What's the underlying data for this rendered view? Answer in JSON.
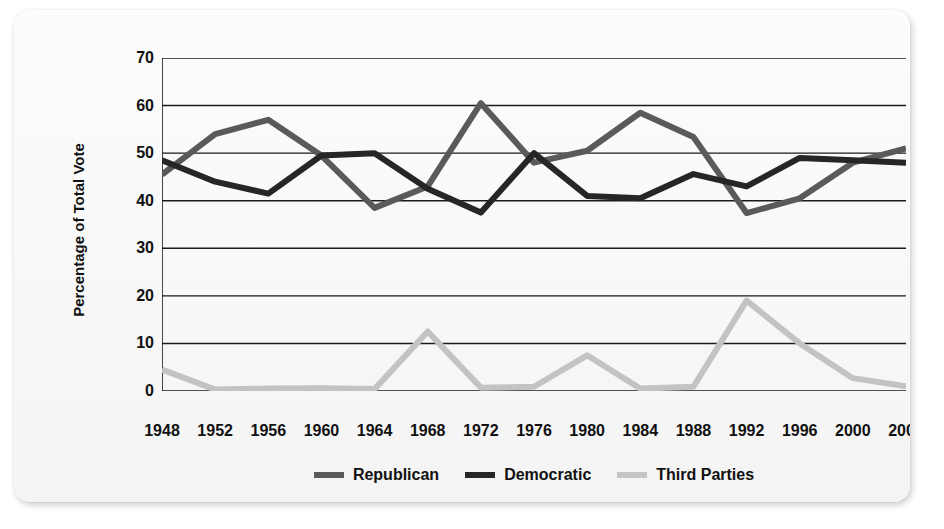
{
  "chart_data": {
    "type": "line",
    "title": "",
    "xlabel": "",
    "ylabel": "Percentage of Total Vote",
    "ylim": [
      0,
      70
    ],
    "yticks": [
      0,
      10,
      20,
      30,
      40,
      50,
      60,
      70
    ],
    "grid": true,
    "legend_position": "bottom",
    "categories": [
      "1948",
      "1952",
      "1956",
      "1960",
      "1964",
      "1968",
      "1972",
      "1976",
      "1980",
      "1984",
      "1988",
      "1992",
      "1996",
      "2000",
      "2004"
    ],
    "series": [
      {
        "name": "Republican",
        "color": "#5a5a5a",
        "values": [
          45.5,
          54.0,
          57.0,
          49.5,
          38.5,
          43.0,
          60.5,
          48.0,
          50.5,
          58.5,
          53.4,
          37.4,
          40.5,
          48.0,
          51.0
        ]
      },
      {
        "name": "Democratic",
        "color": "#262626",
        "values": [
          48.5,
          44.0,
          41.5,
          49.5,
          50.0,
          42.5,
          37.5,
          50.0,
          41.0,
          40.5,
          45.6,
          43.0,
          49.0,
          48.5,
          48.0
        ]
      },
      {
        "name": "Third Parties",
        "color": "#c3c3c3",
        "values": [
          4.5,
          0.3,
          0.5,
          0.6,
          0.4,
          12.5,
          0.7,
          0.9,
          7.5,
          0.5,
          0.9,
          19.0,
          10.0,
          2.7,
          1.0
        ]
      }
    ]
  },
  "axis": {
    "y_label": "Percentage of Total Vote",
    "y_tick_labels": [
      "0",
      "10",
      "20",
      "30",
      "40",
      "50",
      "60",
      "70"
    ],
    "x_tick_labels": [
      "1948",
      "1952",
      "1956",
      "1960",
      "1964",
      "1968",
      "1972",
      "1976",
      "1980",
      "1984",
      "1988",
      "1992",
      "1996",
      "2000",
      "2004"
    ]
  },
  "legend": {
    "items": [
      {
        "label": "Republican",
        "color": "#5a5a5a"
      },
      {
        "label": "Democratic",
        "color": "#262626"
      },
      {
        "label": "Third Parties",
        "color": "#c6c6c6"
      }
    ]
  },
  "colors": {
    "republican": "#5a5a5a",
    "democratic": "#262626",
    "third_parties": "#c6c6c6",
    "grid": "#1a1a1a",
    "card_background": "#fbfbfb"
  }
}
